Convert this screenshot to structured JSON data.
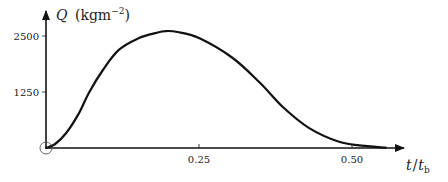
{
  "chart_data": {
    "type": "line",
    "title": "",
    "xlabel": "t/t_b",
    "ylabel": "Q (kgm^-2)",
    "xlabel_parts": {
      "main": "t",
      "slash": "/",
      "sub_var": "t",
      "subscript": "b"
    },
    "ylabel_parts": {
      "var": "Q",
      "unit_open": "(kgm",
      "exponent": "−2",
      "unit_close": ")"
    },
    "x_ticks": [
      {
        "value": 0.25,
        "label": "0.25"
      },
      {
        "value": 0.5,
        "label": "0.50"
      }
    ],
    "y_ticks": [
      {
        "value": 1250,
        "label": "1250"
      },
      {
        "value": 2500,
        "label": "2500"
      }
    ],
    "xlim": [
      0,
      0.58
    ],
    "ylim": [
      0,
      2800
    ],
    "grid": false,
    "legend": null,
    "origin_marker": "open-circle",
    "series": [
      {
        "name": "Q",
        "color": "#111111",
        "x": [
          0.0,
          0.015,
          0.033,
          0.054,
          0.07,
          0.093,
          0.119,
          0.152,
          0.18,
          0.195,
          0.215,
          0.25,
          0.305,
          0.35,
          0.387,
          0.43,
          0.48,
          0.525,
          0.555
        ],
        "y": [
          0,
          90,
          335,
          780,
          1230,
          1740,
          2190,
          2455,
          2570,
          2610,
          2590,
          2455,
          2010,
          1450,
          915,
          445,
          135,
          40,
          10
        ]
      }
    ]
  }
}
